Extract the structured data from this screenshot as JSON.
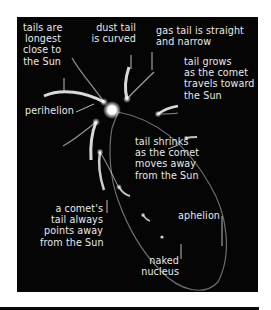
{
  "diagram": {
    "background_color": "#050505",
    "text_color": "#e8e8e8",
    "labels": {
      "tails_longest": "tails are\nlongest\nclose to\nthe Sun",
      "dust_tail": "dust tail\nis curved",
      "gas_tail": "gas tail is straight\nand narrow",
      "tail_grows": "tail grows\nas the comet\ntravels toward\nthe Sun",
      "perihelion": "perihelion",
      "tail_shrinks": "tail shrinks\nas the comet\nmoves away\nfrom the Sun",
      "tail_points_away": "a comet's\ntail always\npoints away\nfrom the Sun",
      "aphelion": "aphelion",
      "naked_nucleus": "naked\nnucleus"
    },
    "elements": [
      "sun",
      "elliptical-orbit",
      "comet-positions",
      "leader-lines"
    ]
  }
}
